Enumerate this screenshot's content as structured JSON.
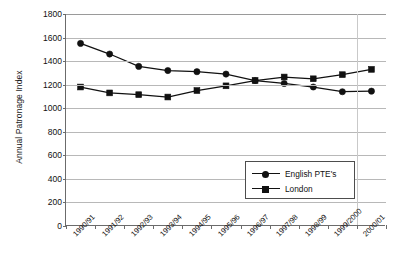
{
  "chart_data": {
    "type": "line",
    "title": "",
    "xlabel": "",
    "ylabel": "Annual Patronage Index",
    "ylim": [
      0,
      1800
    ],
    "ytick_step": 200,
    "yticks": [
      "1800",
      "1600",
      "1400",
      "1200",
      "1000",
      "800",
      "600",
      "400",
      "200",
      "0"
    ],
    "grid": true,
    "legend_position": "inside-bottom-right",
    "categories": [
      "1990/91",
      "1991/92",
      "1992/93",
      "1993/94",
      "1994/95",
      "1995/96",
      "1996/97",
      "1997/98",
      "1998/99",
      "1999/2000",
      "2000/01"
    ],
    "series": [
      {
        "name": "English PTE's",
        "marker": "circle",
        "color": "#111111",
        "values": [
          1550,
          1460,
          1355,
          1320,
          1310,
          1290,
          1235,
          1210,
          1180,
          1140,
          1145
        ]
      },
      {
        "name": "London",
        "marker": "square",
        "color": "#111111",
        "values": [
          1180,
          1130,
          1115,
          1095,
          1150,
          1190,
          1235,
          1265,
          1250,
          1285,
          1330
        ]
      }
    ]
  },
  "legend": {
    "entries": [
      {
        "label": "English PTE's",
        "marker": "circle"
      },
      {
        "label": "London",
        "marker": "square"
      }
    ]
  }
}
